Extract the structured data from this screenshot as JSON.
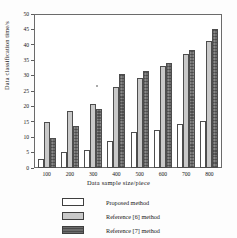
{
  "chart_data": {
    "type": "bar",
    "title": "",
    "xlabel": "Data sample size/piece",
    "ylabel": "Data classification time/s",
    "categories": [
      "100",
      "200",
      "300",
      "400",
      "500",
      "600",
      "700",
      "800"
    ],
    "series": [
      {
        "name": "Proposed method",
        "values": [
          3.0,
          5.2,
          5.8,
          8.8,
          11.7,
          12.5,
          14.3,
          15.2
        ]
      },
      {
        "name": "Reference [6] method",
        "values": [
          14.8,
          18.6,
          20.7,
          26.3,
          29.1,
          33.1,
          37.0,
          41.1
        ]
      },
      {
        "name": "Reference [7] method",
        "values": [
          9.6,
          13.7,
          19.2,
          30.5,
          31.6,
          34.2,
          38.3,
          45.2
        ]
      }
    ],
    "ylim": [
      0,
      50
    ],
    "yticks": [
      "0",
      "5",
      "10",
      "15",
      "20",
      "25",
      "30",
      "35",
      "40",
      "45",
      "50"
    ],
    "grid": false,
    "legend_position": "below-plot",
    "colors": {
      "series_0": "#ffffff",
      "series_1": "#c9c9c9",
      "series_2": "#6e6e6e",
      "axis": "#6b6b6b",
      "text": "#171717"
    }
  }
}
